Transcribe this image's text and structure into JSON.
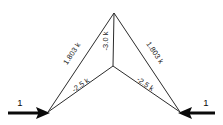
{
  "figure": {
    "background_color": "#ffffff",
    "member_color": "#2b2b2b",
    "load_color": "#0a0a0a",
    "units_note": "k"
  },
  "nodes": {
    "apex": {
      "name": "apex-node",
      "x": 114,
      "y": 13
    },
    "center": {
      "name": "center-node",
      "x": 113,
      "y": 66
    },
    "left_support": {
      "name": "left-support-node",
      "x": 48,
      "y": 112
    },
    "right_support": {
      "name": "right-support-node",
      "x": 180,
      "y": 112
    }
  },
  "members": [
    {
      "id": "left-diagonal",
      "label": "1.803 k",
      "from": "left_support",
      "to": "apex"
    },
    {
      "id": "vertical",
      "label": "-3.0 k",
      "from": "apex",
      "to": "center"
    },
    {
      "id": "right-diagonal",
      "label": "1.803 k",
      "from": "apex",
      "to": "right_support"
    },
    {
      "id": "left-bottom-chord",
      "label": "-2.5 k",
      "from": "left_support",
      "to": "center"
    },
    {
      "id": "right-bottom-chord",
      "label": "-2.5 k",
      "from": "center",
      "to": "right_support"
    }
  ],
  "loads": [
    {
      "id": "left-load",
      "label": "1",
      "direction": "right",
      "at": "left_support"
    },
    {
      "id": "right-load",
      "label": "1",
      "direction": "left",
      "at": "right_support"
    }
  ]
}
